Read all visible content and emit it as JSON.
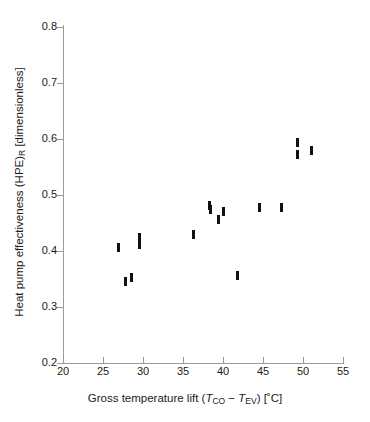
{
  "chart_data": {
    "type": "scatter",
    "title": "",
    "xlabel": "Gross temperature lift (T_CO − T_EV) [°C]",
    "ylabel": "Heat pump effectiveness (HPE)_R [dimensionless]",
    "xlim": [
      20,
      55
    ],
    "ylim": [
      0.2,
      0.8
    ],
    "xticks": [
      20,
      25,
      30,
      35,
      40,
      45,
      50,
      55
    ],
    "yticks": [
      0.2,
      0.3,
      0.4,
      0.5,
      0.6,
      0.7,
      0.8
    ],
    "grid": false,
    "legend": false,
    "marker_color": "#111111",
    "marker_style": "vertical-bar",
    "points": [
      {
        "x": 26.9,
        "y": 0.407
      },
      {
        "x": 27.8,
        "y": 0.345
      },
      {
        "x": 28.5,
        "y": 0.352
      },
      {
        "x": 29.5,
        "y": 0.411
      },
      {
        "x": 29.6,
        "y": 0.425
      },
      {
        "x": 36.3,
        "y": 0.43
      },
      {
        "x": 38.3,
        "y": 0.482
      },
      {
        "x": 38.4,
        "y": 0.475
      },
      {
        "x": 39.4,
        "y": 0.457
      },
      {
        "x": 40.0,
        "y": 0.47
      },
      {
        "x": 41.8,
        "y": 0.357
      },
      {
        "x": 44.5,
        "y": 0.478
      },
      {
        "x": 47.3,
        "y": 0.477
      },
      {
        "x": 49.3,
        "y": 0.593
      },
      {
        "x": 49.3,
        "y": 0.573
      },
      {
        "x": 51.1,
        "y": 0.58
      }
    ]
  },
  "axes": {
    "x_tick_labels": [
      "20",
      "25",
      "30",
      "35",
      "40",
      "45",
      "50",
      "55"
    ],
    "y_tick_labels": [
      "0.8",
      "0.7",
      "0.6",
      "0.5",
      "0.4",
      "0.3",
      "0.2"
    ],
    "x_title_parts": {
      "lead": "Gross temperature lift (",
      "sym1": "T",
      "sub1": "CO",
      "minus": " − ",
      "sym2": "T",
      "sub2": "EV",
      "tail": ") [˚C]"
    },
    "y_title_parts": {
      "lead": "Heat pump effectiveness (HPE)",
      "sub": "R",
      "tail": " [dimensionless]"
    }
  }
}
